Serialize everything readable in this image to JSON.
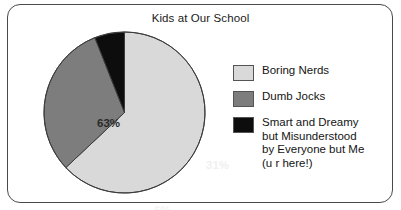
{
  "chart_data": {
    "type": "pie",
    "title": "Kids at Our School",
    "categories": [
      "Boring Nerds",
      "Dumb Jocks",
      "Smart and Dreamy but Misunderstood by Everyone but Me (u r here!)"
    ],
    "values": [
      63,
      31,
      6
    ],
    "value_labels": [
      "63%",
      "31%",
      "6%"
    ],
    "unit": "percent",
    "colors": [
      "#d9d9d9",
      "#7d7d7d",
      "#0d0d0d"
    ],
    "legend_position": "right",
    "grid": false,
    "start_angle_deg": 0,
    "direction": "clockwise",
    "xlabel": "",
    "ylabel": ""
  },
  "frame": {
    "border_color": "#4a4a4a",
    "background": "#ffffff"
  },
  "title": {
    "text": "Kids at Our School"
  },
  "pie": {
    "slices": [
      {
        "key": "boring-nerds",
        "name": "Boring Nerds",
        "percent": 63,
        "label": "63%",
        "color": "#d9d9d9",
        "label_color": "#2b2b2b"
      },
      {
        "key": "dumb-jocks",
        "name": "Dumb Jocks",
        "percent": 31,
        "label": "31%",
        "color": "#7d7d7d",
        "label_color": "#f0f0f0"
      },
      {
        "key": "smart-and-dreamy",
        "name": "Smart and Dreamy but Misunderstood by Everyone but Me (u r here!)",
        "percent": 6,
        "label": "6%",
        "color": "#0d0d0d",
        "label_color": "#f2f2f2"
      }
    ],
    "outline_color": "#3c3c3c"
  },
  "legend": {
    "items": [
      {
        "swatch_color": "#d9d9d9",
        "label": "Boring Nerds"
      },
      {
        "swatch_color": "#7d7d7d",
        "label": "Dumb Jocks"
      },
      {
        "swatch_color": "#0d0d0d",
        "label": "Smart and Dreamy\nbut Misunderstood\nby Everyone but Me\n(u r here!)"
      }
    ]
  }
}
